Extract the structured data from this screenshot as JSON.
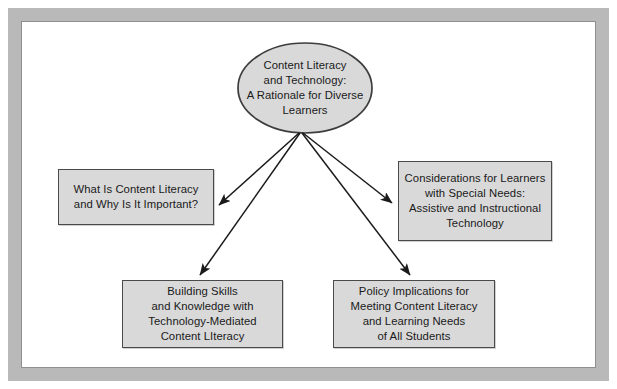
{
  "diagram": {
    "title": "Content Literacy and Technology: A Rationale for Diverse Learners",
    "type": "hub-and-spoke concept map",
    "colors": {
      "frame": "#b9b9b9",
      "frame_inner_line": "#8f8f8f",
      "node_fill": "#d9d9d9",
      "node_border": "#4a4a4a",
      "arrow": "#1a1a1a",
      "text": "#1a1a1a",
      "page_background": "#ffffff"
    },
    "root": {
      "shape": "ellipse",
      "label": "Content Literacy\nand Technology:\nA Rationale for Diverse\nLearners",
      "lines": [
        "Content Literacy",
        "and Technology:",
        "A Rationale for Diverse",
        "Learners"
      ]
    },
    "branches": [
      {
        "id": "left",
        "shape": "rectangle",
        "label": "What Is Content Literacy\nand Why Is It Important?",
        "lines": [
          "What Is Content Literacy",
          "and Why Is It Important?"
        ]
      },
      {
        "id": "right",
        "shape": "rectangle",
        "label": "Considerations for Learners\nwith Special Needs:\nAssistive and Instructional\nTechnology",
        "lines": [
          "Considerations for Learners",
          "with Special Needs:",
          "Assistive and Instructional",
          "Technology"
        ]
      },
      {
        "id": "bottom-left",
        "shape": "rectangle",
        "label": "Building Skills\nand Knowledge with\nTechnology-Mediated\nContent LIteracy",
        "lines": [
          "Building Skills",
          "and Knowledge with",
          "Technology-Mediated",
          "Content LIteracy"
        ]
      },
      {
        "id": "bottom-right",
        "shape": "rectangle",
        "label": "Policy Implications for\nMeeting Content Literacy\nand Learning Needs\nof All Students",
        "lines": [
          "Policy Implications for",
          "Meeting Content Literacy",
          "and Learning Needs",
          "of All Students"
        ]
      }
    ],
    "connectors": [
      {
        "id": "arrow-to-left",
        "from": "root",
        "to": "left",
        "style": "solid-arrow"
      },
      {
        "id": "arrow-to-right",
        "from": "root",
        "to": "right",
        "style": "solid-arrow"
      },
      {
        "id": "arrow-to-bottom-left",
        "from": "root",
        "to": "bottom-left",
        "style": "solid-arrow"
      },
      {
        "id": "arrow-to-bottom-right",
        "from": "root",
        "to": "bottom-right",
        "style": "solid-arrow"
      }
    ]
  }
}
